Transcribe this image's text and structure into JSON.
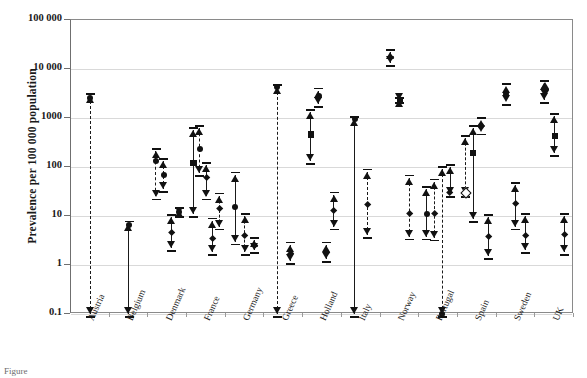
{
  "figure": {
    "caption_fragment": "Figure",
    "ylabel": "Prevalence per 100 000 population"
  },
  "chart_data": {
    "type": "scatter",
    "title": "",
    "xlabel": "",
    "ylabel": "Prevalence per 100 000 population",
    "yscale": "log",
    "ylim": [
      0.1,
      100000
    ],
    "ytick_labels": [
      "100 000",
      "10 000",
      "1000",
      "100",
      "10",
      "1",
      "0.1"
    ],
    "ytick_values": [
      100000,
      10000,
      1000,
      100,
      10,
      1,
      0.1
    ],
    "grid": "horizontal",
    "legend": "none",
    "categories": [
      "Austria",
      "Belgium",
      "Denmark",
      "France",
      "Germany",
      "Greece",
      "Holland",
      "Italy",
      "Norway",
      "Portugal",
      "Spain",
      "Sweden",
      "UK"
    ],
    "series": [
      {
        "country": "Austria",
        "points": [
          {
            "marker": "circle",
            "line": "dashed",
            "low": 0.1,
            "high": 2800,
            "value": 2600,
            "truncated_low": true
          }
        ]
      },
      {
        "country": "Belgium",
        "points": [
          {
            "marker": "circle",
            "line": "solid",
            "low": 0.1,
            "high": 7.0,
            "value": 6.5,
            "truncated_low": true
          }
        ]
      },
      {
        "country": "Denmark",
        "points": [
          {
            "marker": "circle",
            "line": "dashed",
            "low": 25,
            "high": 210,
            "value": 130
          },
          {
            "marker": "circle",
            "line": "dashed",
            "low": 35,
            "high": 130,
            "value": 70
          },
          {
            "marker": "diamond",
            "line": "solid",
            "low": 2.2,
            "high": 9.5,
            "value": 4.5
          },
          {
            "marker": "circle",
            "line": "none",
            "low": 11,
            "high": 13,
            "value": 12
          }
        ]
      },
      {
        "country": "France",
        "points": [
          {
            "marker": "square",
            "line": "solid",
            "low": 11,
            "high": 570,
            "value": 120
          },
          {
            "marker": "circle",
            "line": "dashed",
            "low": 75,
            "high": 620,
            "value": 230
          },
          {
            "marker": "diamond",
            "line": "solid",
            "low": 25,
            "high": 110,
            "value": 60
          },
          {
            "marker": "diamond",
            "line": "solid",
            "low": 1.8,
            "high": 8.0,
            "value": 3.4
          },
          {
            "marker": "diamond",
            "line": "dashed",
            "low": 6.0,
            "high": 26,
            "value": 14
          }
        ]
      },
      {
        "country": "Germany",
        "points": [
          {
            "marker": "circle",
            "line": "solid",
            "low": 3.0,
            "high": 70,
            "value": 15
          },
          {
            "marker": "diamond",
            "line": "dashed",
            "low": 1.8,
            "high": 10,
            "value": 4.0
          },
          {
            "marker": "diamond",
            "line": "solid",
            "low": 2.0,
            "high": 3.2,
            "value": 2.5
          }
        ]
      },
      {
        "country": "Greece",
        "points": [
          {
            "marker": "circle",
            "line": "dashed",
            "low": 0.1,
            "high": 4300,
            "value": 4300,
            "truncated_low": true
          },
          {
            "marker": "diamond",
            "line": "solid",
            "low": 1.2,
            "high": 2.6,
            "value": 1.7
          }
        ]
      },
      {
        "country": "Holland",
        "points": [
          {
            "marker": "square",
            "line": "solid",
            "low": 130,
            "high": 1300,
            "value": 460
          },
          {
            "marker": "circle",
            "line": "solid",
            "low": 1900,
            "high": 3600,
            "value": 2800
          },
          {
            "marker": "diamond",
            "line": "solid",
            "low": 1.3,
            "high": 2.6,
            "value": 1.8
          },
          {
            "marker": "diamond",
            "line": "solid",
            "low": 6.0,
            "high": 27,
            "value": 13
          }
        ]
      },
      {
        "country": "Italy",
        "points": [
          {
            "marker": "circle",
            "line": "solid",
            "low": 0.1,
            "high": 950,
            "value": 950,
            "truncated_low": true
          },
          {
            "marker": "diamond",
            "line": "dashed",
            "low": 4.0,
            "high": 80,
            "value": 17
          }
        ]
      },
      {
        "country": "Norway",
        "points": [
          {
            "marker": "diamond",
            "line": "solid",
            "low": 13000,
            "high": 22000,
            "value": 17000
          },
          {
            "marker": "square",
            "line": "none",
            "low": 2300,
            "high": 2300,
            "value": 2300
          },
          {
            "marker": "diamond",
            "line": "dashed",
            "low": 3.8,
            "high": 60,
            "value": 11
          }
        ]
      },
      {
        "country": "Portugal",
        "points": [
          {
            "marker": "circle",
            "line": "solid",
            "low": 3.8,
            "high": 35,
            "value": 11
          },
          {
            "marker": "diamond",
            "line": "dashed",
            "low": 3.6,
            "high": 50,
            "value": 11
          },
          {
            "marker": "circle",
            "line": "dashed",
            "low": 0.1,
            "high": 90,
            "value": 0.1,
            "truncated_low": true
          },
          {
            "marker": "arrow",
            "line": "solid",
            "low": 28,
            "high": 100,
            "value": 30
          }
        ]
      },
      {
        "country": "Spain",
        "points": [
          {
            "marker": "opendiamond",
            "line": "dashed",
            "low": 28,
            "high": 390,
            "value": 30
          },
          {
            "marker": "square",
            "line": "solid",
            "low": 8.5,
            "high": 620,
            "value": 190
          },
          {
            "marker": "circle",
            "line": "none",
            "low": 530,
            "high": 900,
            "value": 700
          },
          {
            "marker": "diamond",
            "line": "solid",
            "low": 1.5,
            "high": 9.5,
            "value": 3.8
          }
        ]
      },
      {
        "country": "Sweden",
        "points": [
          {
            "marker": "circle",
            "line": "none",
            "low": 2100,
            "high": 4500,
            "value": 3100
          },
          {
            "marker": "diamond",
            "line": "solid",
            "low": 6.0,
            "high": 42,
            "value": 18
          },
          {
            "marker": "diamond",
            "line": "solid",
            "low": 2.0,
            "high": 10,
            "value": 4.0
          }
        ]
      },
      {
        "country": "UK",
        "points": [
          {
            "marker": "bigdiamond",
            "line": "solid",
            "low": 2300,
            "high": 5200,
            "value": 3800
          },
          {
            "marker": "square",
            "line": "solid",
            "low": 190,
            "high": 1100,
            "value": 430
          },
          {
            "marker": "diamond",
            "line": "solid",
            "low": 1.8,
            "high": 10,
            "value": 4.2
          }
        ]
      }
    ]
  }
}
